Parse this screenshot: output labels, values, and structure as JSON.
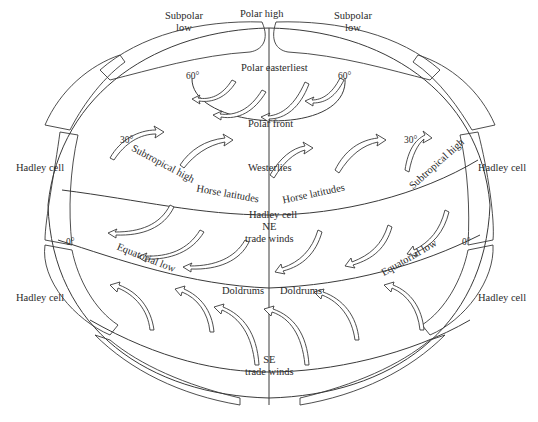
{
  "diagram": {
    "top_labels": {
      "polar_high": "Polar high",
      "subpolar_low_left": [
        "Subpolar",
        "low"
      ],
      "subpolar_low_right": [
        "Subpolar",
        "low"
      ]
    },
    "latitudes": {
      "lat60_left": "60°",
      "lat60_right": "60°",
      "lat30_left": "30°",
      "lat30_right": "30°",
      "lat0_left": "0°",
      "lat0_right": "0°"
    },
    "zones": {
      "polar_easterlies": "Polar easterliest",
      "polar_front": "Polar front",
      "westerlies": "Westerlies",
      "subtropical_high_left": "Subtropical high",
      "subtropical_high_right": "Subtropical high",
      "horse_latitudes_left": "Horse latitudes",
      "horse_latitudes_right": "Horse latitudes",
      "hadley_center": "Hadley cell",
      "ne_trade": [
        "NE",
        "trade winds"
      ],
      "equatorial_low_left": "Equatorial low",
      "equatorial_low_right": "Equatorial low",
      "doldrums_left": "Doldrums",
      "doldrums_right": "Doldrums",
      "se_trade": [
        "SE",
        "trade winds"
      ]
    },
    "side_labels": {
      "hadley_left_upper": "Hadley cell",
      "hadley_left_lower": "Hadley cell",
      "hadley_right_upper": "Hadley cell",
      "hadley_right_lower": "Hadley cell"
    },
    "colors": {
      "stroke": "#3a3a3a",
      "text": "#2a2a2a",
      "background": "#ffffff"
    }
  }
}
